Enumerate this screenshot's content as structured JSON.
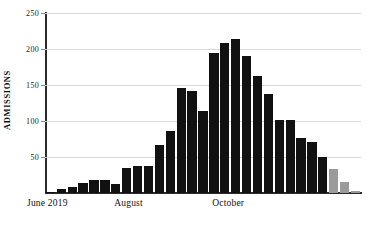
{
  "chart_data": {
    "type": "bar",
    "title": "",
    "subtitle": "",
    "xlabel": "",
    "ylabel": "ADMISSIONS",
    "ylim": [
      0,
      250
    ],
    "ytick_values": [
      250,
      200,
      150,
      100,
      50
    ],
    "ytick_labels": [
      "250",
      "200",
      "150",
      "100",
      "50"
    ],
    "grid": true,
    "legend": "none",
    "x_axis_tick_labels": [
      {
        "label": "June 2019",
        "at_bar_index": 0
      },
      {
        "label": "August",
        "at_bar_index": 8
      },
      {
        "label": "October",
        "at_bar_index": 17
      }
    ],
    "categories": [
      "w1",
      "w2",
      "w3",
      "w4",
      "w5",
      "w6",
      "w7",
      "w8",
      "w9",
      "w10",
      "w11",
      "w12",
      "w13",
      "w14",
      "w15",
      "w16",
      "w17",
      "w18",
      "w19",
      "w20",
      "w21",
      "w22",
      "w23",
      "w24",
      "w25",
      "w26",
      "w27",
      "w28",
      "w29"
    ],
    "values": [
      2,
      5,
      9,
      14,
      18,
      18,
      12,
      35,
      37,
      37,
      66,
      86,
      146,
      141,
      114,
      195,
      208,
      214,
      190,
      163,
      138,
      101,
      101,
      76,
      71,
      50,
      33,
      15,
      3
    ],
    "bar_colors": [
      "#111111",
      "#111111",
      "#111111",
      "#111111",
      "#111111",
      "#111111",
      "#111111",
      "#111111",
      "#111111",
      "#111111",
      "#111111",
      "#111111",
      "#111111",
      "#111111",
      "#111111",
      "#111111",
      "#111111",
      "#111111",
      "#111111",
      "#111111",
      "#111111",
      "#111111",
      "#111111",
      "#111111",
      "#111111",
      "#111111",
      "#9a9a9a",
      "#9a9a9a",
      "#9a9a9a"
    ],
    "colors": {
      "bar_primary": "#111111",
      "bar_provisional": "#9a9a9a",
      "gridline": "#d9d9d9",
      "axis": "#2b2b2b",
      "background": "#ffffff",
      "text": "#111111"
    }
  }
}
